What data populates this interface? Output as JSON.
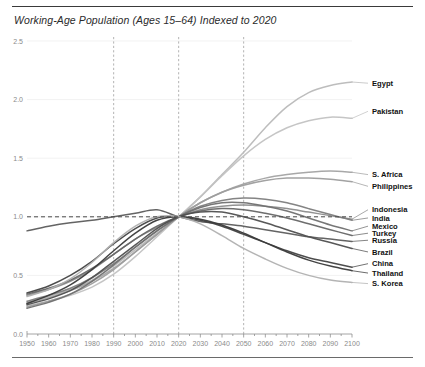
{
  "chart_data": {
    "type": "line",
    "title": "Working-Age Population (Ages 15–64) Indexed to 2020",
    "xlabel": "",
    "ylabel": "",
    "xlim": [
      1950,
      2100
    ],
    "ylim": [
      0.0,
      2.5
    ],
    "grid": true,
    "legend_position": "right-inline-labels",
    "reference_lines": {
      "horizontal": [
        {
          "value": 1.0,
          "style": "dashed",
          "color": "#4a4a4a"
        }
      ],
      "vertical": [
        {
          "value": 1990,
          "style": "dashed",
          "color": "#9a9a9a"
        },
        {
          "value": 2020,
          "style": "dashed",
          "color": "#9a9a9a"
        },
        {
          "value": 2050,
          "style": "dashed",
          "color": "#9a9a9a"
        }
      ]
    },
    "yticks": [
      "0.0",
      "0.5",
      "1.0",
      "1.5",
      "2.0",
      "2.5"
    ],
    "ytick_values": [
      0.0,
      0.5,
      1.0,
      1.5,
      2.0,
      2.5
    ],
    "xticks": [
      "1950",
      "1960",
      "1970",
      "1980",
      "1990",
      "2000",
      "2010",
      "2020",
      "2030",
      "2040",
      "2050",
      "2060",
      "2070",
      "2080",
      "2090",
      "2100"
    ],
    "xtick_values": [
      1950,
      1960,
      1970,
      1980,
      1990,
      2000,
      2010,
      2020,
      2030,
      2040,
      2050,
      2060,
      2070,
      2080,
      2090,
      2100
    ],
    "x": [
      1950,
      1960,
      1970,
      1980,
      1990,
      2000,
      2010,
      2020,
      2030,
      2040,
      2050,
      2060,
      2070,
      2080,
      2090,
      2100
    ],
    "series": [
      {
        "name": "Egypt",
        "color": "#b9b9b9",
        "label_y": 2.14,
        "values": [
          0.27,
          0.32,
          0.38,
          0.46,
          0.58,
          0.72,
          0.86,
          1.0,
          1.17,
          1.36,
          1.55,
          1.76,
          1.94,
          2.06,
          2.12,
          2.15
        ]
      },
      {
        "name": "Pakistan",
        "color": "#c2c2c2",
        "label_y": 1.9,
        "values": [
          0.24,
          0.28,
          0.33,
          0.4,
          0.51,
          0.66,
          0.83,
          1.0,
          1.17,
          1.35,
          1.52,
          1.66,
          1.76,
          1.82,
          1.85,
          1.84
        ]
      },
      {
        "name": "S. Africa",
        "color": "#a3a3a3",
        "label_y": 1.36,
        "values": [
          0.26,
          0.31,
          0.37,
          0.45,
          0.56,
          0.7,
          0.85,
          1.0,
          1.12,
          1.21,
          1.28,
          1.33,
          1.36,
          1.38,
          1.39,
          1.38
        ]
      },
      {
        "name": "Philippines",
        "color": "#9d9d9d",
        "label_y": 1.26,
        "values": [
          0.23,
          0.28,
          0.34,
          0.43,
          0.55,
          0.7,
          0.85,
          1.0,
          1.12,
          1.21,
          1.27,
          1.31,
          1.33,
          1.33,
          1.32,
          1.3
        ]
      },
      {
        "name": "Indonesia",
        "color": "#8c8c8c",
        "label_y": 1.06,
        "values": [
          0.33,
          0.38,
          0.45,
          0.55,
          0.68,
          0.81,
          0.91,
          1.0,
          1.06,
          1.09,
          1.1,
          1.09,
          1.07,
          1.04,
          1.01,
          0.98
        ]
      },
      {
        "name": "India",
        "color": "#7d7d7d",
        "label_y": 0.99,
        "values": [
          0.28,
          0.33,
          0.39,
          0.48,
          0.6,
          0.74,
          0.88,
          1.0,
          1.09,
          1.14,
          1.16,
          1.15,
          1.12,
          1.07,
          1.02,
          0.97
        ]
      },
      {
        "name": "Mexico",
        "color": "#707070",
        "label_y": 0.92,
        "values": [
          0.22,
          0.27,
          0.34,
          0.45,
          0.59,
          0.74,
          0.88,
          1.0,
          1.08,
          1.12,
          1.12,
          1.09,
          1.05,
          0.99,
          0.93,
          0.88
        ]
      },
      {
        "name": "Turkey",
        "color": "#666666",
        "label_y": 0.86,
        "values": [
          0.34,
          0.39,
          0.46,
          0.56,
          0.68,
          0.81,
          0.92,
          1.0,
          1.05,
          1.07,
          1.06,
          1.03,
          0.99,
          0.94,
          0.89,
          0.84
        ]
      },
      {
        "name": "Russia",
        "color": "#5c5c5c",
        "label_y": 0.8,
        "values": [
          0.88,
          0.92,
          0.95,
          0.97,
          1.0,
          1.03,
          1.06,
          1.0,
          0.96,
          0.94,
          0.92,
          0.89,
          0.86,
          0.83,
          0.81,
          0.79
        ]
      },
      {
        "name": "Brazil",
        "color": "#4f4f4f",
        "label_y": 0.7,
        "values": [
          0.25,
          0.3,
          0.37,
          0.48,
          0.62,
          0.76,
          0.9,
          1.0,
          1.04,
          1.04,
          1.0,
          0.95,
          0.89,
          0.83,
          0.78,
          0.73
        ]
      },
      {
        "name": "China",
        "color": "#434343",
        "label_y": 0.6,
        "values": [
          0.35,
          0.41,
          0.5,
          0.62,
          0.77,
          0.9,
          0.99,
          1.0,
          0.97,
          0.92,
          0.85,
          0.78,
          0.71,
          0.65,
          0.61,
          0.57
        ]
      },
      {
        "name": "Thailand",
        "color": "#3a3a3a",
        "label_y": 0.52,
        "values": [
          0.26,
          0.33,
          0.42,
          0.55,
          0.71,
          0.86,
          0.97,
          1.0,
          0.98,
          0.93,
          0.86,
          0.78,
          0.7,
          0.63,
          0.58,
          0.54
        ]
      },
      {
        "name": "S. Korea",
        "color": "#b0b0b0",
        "label_y": 0.43,
        "values": [
          0.32,
          0.38,
          0.47,
          0.61,
          0.78,
          0.92,
          1.0,
          1.0,
          0.94,
          0.84,
          0.73,
          0.64,
          0.56,
          0.5,
          0.46,
          0.44
        ]
      }
    ]
  }
}
